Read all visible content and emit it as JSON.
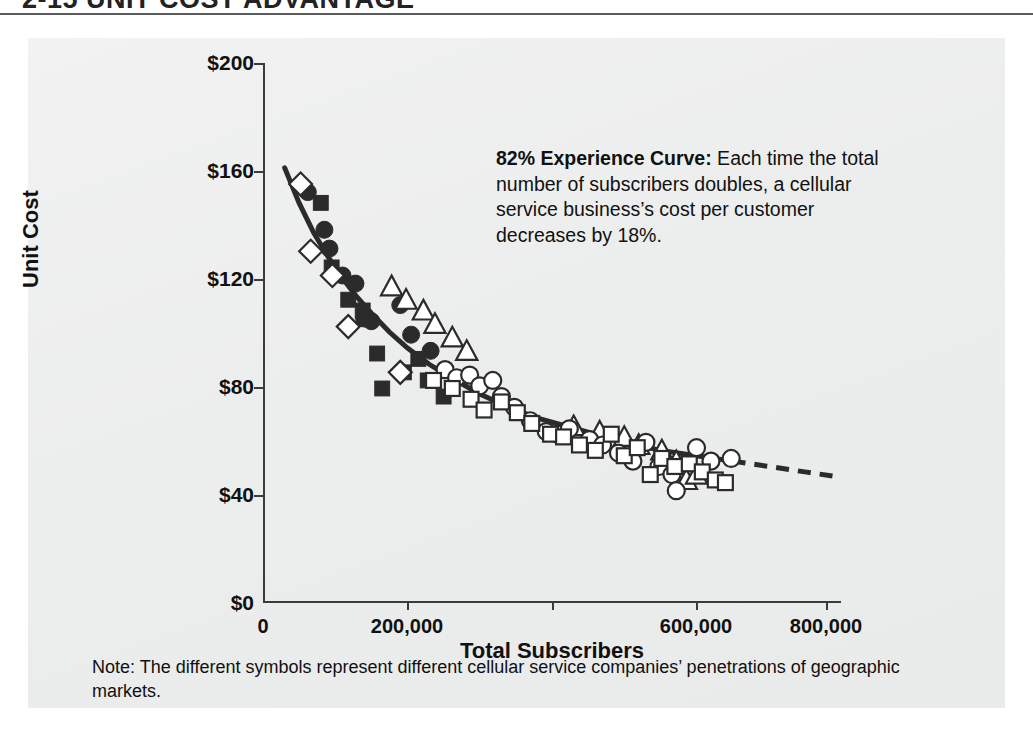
{
  "heading": {
    "text": "2-15 UNIT COST ADVANTAGE"
  },
  "annotation": {
    "lead": "82% Experience Curve:",
    "body": " Each time the total number of subscribers doubles, a cellular service business’s cost per customer decreases by 18%."
  },
  "note": {
    "text": "Note: The different symbols represent different cellular service companies’ penetrations of geographic markets."
  },
  "colors": {
    "panel_background": "#efefef",
    "axis": "#3b3b3b",
    "curve": "#2b2b2b",
    "marker_fill": "#2b2b2b",
    "marker_open": "#ffffff",
    "text": "#111111"
  },
  "chart_data": {
    "type": "scatter",
    "title": "",
    "xlabel": "Total Subscribers",
    "ylabel": "Unit Cost",
    "xlim": [
      0,
      800000
    ],
    "ylim": [
      0,
      200
    ],
    "grid": false,
    "legend": "none",
    "xticks": [
      0,
      200000,
      400000,
      600000,
      800000
    ],
    "xticklabels": [
      "0",
      "200,000",
      "",
      "600,000",
      "800,000"
    ],
    "yticks": [
      0,
      40,
      80,
      120,
      160,
      200
    ],
    "yticklabels": [
      "$0",
      "$40",
      "$80",
      "$120",
      "$160",
      "$200"
    ],
    "fit_curve": {
      "label": "82% experience curve",
      "style_solid_range": [
        30000,
        650000
      ],
      "style_dashed_range": [
        650000,
        800000
      ],
      "points": [
        [
          30000,
          161
        ],
        [
          50000,
          148
        ],
        [
          70000,
          137
        ],
        [
          90000,
          128
        ],
        [
          110000,
          120
        ],
        [
          130000,
          113
        ],
        [
          150000,
          107
        ],
        [
          175000,
          100
        ],
        [
          200000,
          94
        ],
        [
          230000,
          88
        ],
        [
          260000,
          83
        ],
        [
          300000,
          77
        ],
        [
          340000,
          72
        ],
        [
          380000,
          68
        ],
        [
          420000,
          65
        ],
        [
          460000,
          62
        ],
        [
          500000,
          59
        ],
        [
          550000,
          56
        ],
        [
          600000,
          54
        ],
        [
          650000,
          52
        ],
        [
          700000,
          50
        ],
        [
          750000,
          48
        ],
        [
          800000,
          46
        ]
      ]
    },
    "series": [
      {
        "name": "Company A",
        "marker": "filled-circle",
        "points": [
          [
            62000,
            152
          ],
          [
            85000,
            138
          ],
          [
            92000,
            131
          ],
          [
            110000,
            121
          ],
          [
            128000,
            118
          ],
          [
            140000,
            105
          ],
          [
            150000,
            104
          ],
          [
            190000,
            110
          ],
          [
            205000,
            99
          ],
          [
            232000,
            93
          ]
        ]
      },
      {
        "name": "Company B",
        "marker": "filled-square",
        "points": [
          [
            80000,
            148
          ],
          [
            95000,
            124
          ],
          [
            118000,
            112
          ],
          [
            138000,
            108
          ],
          [
            158000,
            92
          ],
          [
            165000,
            79
          ],
          [
            195000,
            85
          ],
          [
            215000,
            90
          ],
          [
            228000,
            82
          ],
          [
            250000,
            76
          ]
        ]
      },
      {
        "name": "Company C",
        "marker": "open-diamond",
        "points": [
          [
            52000,
            155
          ],
          [
            66000,
            130
          ],
          [
            96000,
            121
          ],
          [
            118000,
            102
          ],
          [
            190000,
            85
          ]
        ]
      },
      {
        "name": "Company D",
        "marker": "open-triangle",
        "points": [
          [
            178000,
            117
          ],
          [
            198000,
            112
          ],
          [
            222000,
            108
          ],
          [
            238000,
            103
          ],
          [
            262000,
            98
          ],
          [
            282000,
            93
          ],
          [
            430000,
            65
          ],
          [
            466000,
            63
          ],
          [
            500000,
            61
          ],
          [
            520000,
            58
          ],
          [
            552000,
            56
          ],
          [
            572000,
            52
          ],
          [
            586000,
            45
          ],
          [
            600000,
            47
          ]
        ]
      },
      {
        "name": "Company E",
        "marker": "open-circle",
        "points": [
          [
            252000,
            86
          ],
          [
            268000,
            83
          ],
          [
            286000,
            84
          ],
          [
            300000,
            80
          ],
          [
            318000,
            82
          ],
          [
            330000,
            76
          ],
          [
            348000,
            72
          ],
          [
            370000,
            67
          ],
          [
            392000,
            63
          ],
          [
            408000,
            62
          ],
          [
            424000,
            64
          ],
          [
            452000,
            60
          ],
          [
            470000,
            58
          ],
          [
            492000,
            55
          ],
          [
            512000,
            52
          ],
          [
            530000,
            59
          ],
          [
            548000,
            50
          ],
          [
            566000,
            47
          ],
          [
            572000,
            41
          ],
          [
            600000,
            57
          ],
          [
            620000,
            52
          ],
          [
            648000,
            53
          ]
        ]
      },
      {
        "name": "Company F",
        "marker": "open-square",
        "points": [
          [
            236000,
            82
          ],
          [
            262000,
            79
          ],
          [
            288000,
            75
          ],
          [
            306000,
            71
          ],
          [
            330000,
            74
          ],
          [
            352000,
            70
          ],
          [
            372000,
            66
          ],
          [
            398000,
            62
          ],
          [
            416000,
            61
          ],
          [
            438000,
            58
          ],
          [
            460000,
            56
          ],
          [
            482000,
            62
          ],
          [
            500000,
            54
          ],
          [
            518000,
            57
          ],
          [
            536000,
            47
          ],
          [
            552000,
            53
          ],
          [
            570000,
            50
          ],
          [
            590000,
            51
          ],
          [
            608000,
            48
          ],
          [
            626000,
            45
          ],
          [
            640000,
            44
          ]
        ]
      }
    ]
  }
}
